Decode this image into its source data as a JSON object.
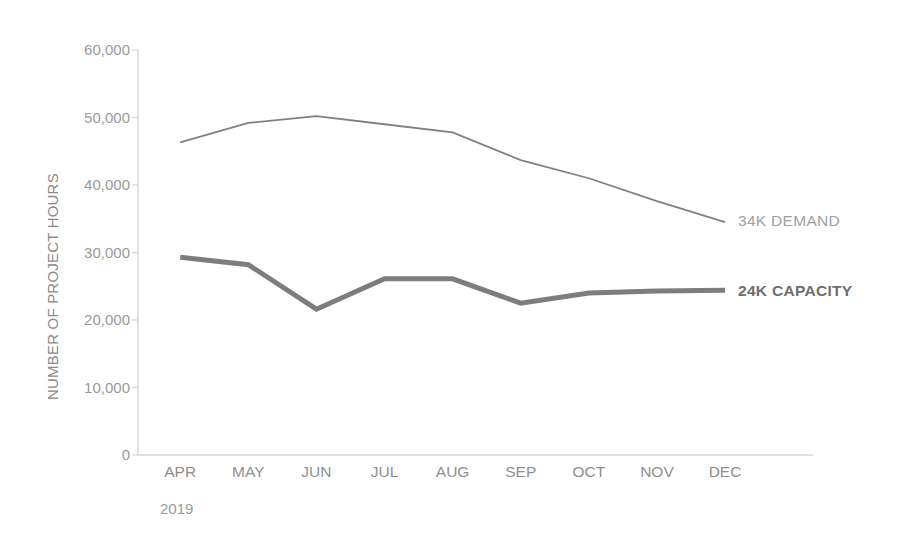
{
  "chart_data": {
    "type": "line",
    "title": "",
    "xlabel": "",
    "ylabel": "NUMBER OF PROJECT HOURS",
    "period": "2019",
    "categories": [
      "APR",
      "MAY",
      "JUN",
      "JUL",
      "AUG",
      "SEP",
      "OCT",
      "NOV",
      "DEC"
    ],
    "ylim": [
      0,
      60000
    ],
    "ytick_labels": [
      "60,000",
      "50,000",
      "40,000",
      "30,000",
      "20,000",
      "10,000",
      "0"
    ],
    "ytick_values": [
      60000,
      50000,
      40000,
      30000,
      20000,
      10000,
      0
    ],
    "grid": false,
    "legend_position": "right-inline-annotation",
    "series": [
      {
        "name": "DEMAND",
        "end_label": "34K",
        "end_label_text": "DEMAND",
        "color": "#808080",
        "line_width": 1.8,
        "emphasis": "normal",
        "values": [
          46300,
          49200,
          50200,
          49000,
          47800,
          43700,
          41000,
          37600,
          34500
        ]
      },
      {
        "name": "CAPACITY",
        "end_label": "24K",
        "end_label_text": "CAPACITY",
        "color": "#7d7d7d",
        "line_width": 5.0,
        "emphasis": "bold",
        "values": [
          29300,
          28200,
          21600,
          26100,
          26100,
          22500,
          24000,
          24300,
          24400
        ]
      }
    ],
    "annotations": [
      {
        "text": "34K  DEMAND",
        "value_text": "34K",
        "label_text": "DEMAND",
        "series": "DEMAND"
      },
      {
        "text": "24K  CAPACITY",
        "value_text": "24K",
        "label_text": "CAPACITY",
        "series": "CAPACITY"
      }
    ],
    "colors": {
      "axis": "#d6d6d6",
      "tick_text": "#9a9a9a",
      "demand_line": "#808080",
      "capacity_line": "#7d7d7d",
      "demand_label": "#a0a0a0",
      "capacity_label": "#6e6e6e",
      "background": "#ffffff"
    },
    "geometry": {
      "plot_left": 138,
      "plot_right": 723,
      "plot_top": 50,
      "plot_bottom": 455,
      "x_step": 68.1
    }
  }
}
